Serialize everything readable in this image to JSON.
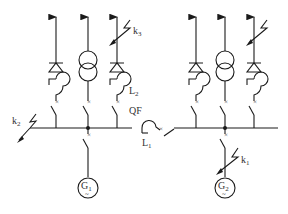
{
  "diagram": {
    "type": "single-line electrical power system diagram",
    "colors": {
      "line": "#1a1a1a",
      "text": "#333333",
      "background": "#ffffff"
    },
    "labels": {
      "k3": {
        "base": "k",
        "sub": "3"
      },
      "k2": {
        "base": "k",
        "sub": "2"
      },
      "k1": {
        "base": "k",
        "sub": "1"
      },
      "L2": {
        "base": "L",
        "sub": "2"
      },
      "L1": {
        "base": "L",
        "sub": "1"
      },
      "QF": {
        "base": "QF",
        "sub": ""
      },
      "G1": {
        "base": "G",
        "sub": "1",
        "symbol": "~"
      },
      "G2": {
        "base": "G",
        "sub": "2",
        "symbol": "~"
      }
    },
    "left_section": {
      "feeders": [
        {
          "id": "left-feeder-1",
          "elements": [
            "arrow",
            "diode-triangle",
            "reactor",
            "breaker"
          ]
        },
        {
          "id": "left-feeder-2",
          "elements": [
            "arrow",
            "transformer",
            "breaker"
          ]
        },
        {
          "id": "left-feeder-3",
          "elements": [
            "arrow",
            "fault-k3",
            "diode-triangle",
            "reactor-L2",
            "breaker"
          ]
        }
      ],
      "generator": "G1",
      "bus_fault": "k2"
    },
    "tie": {
      "reactor": "L1",
      "breaker": "QF"
    },
    "right_section": {
      "feeders": [
        {
          "id": "right-feeder-1",
          "elements": [
            "arrow",
            "diode-triangle",
            "reactor",
            "breaker"
          ]
        },
        {
          "id": "right-feeder-2",
          "elements": [
            "arrow",
            "transformer",
            "breaker"
          ]
        },
        {
          "id": "right-feeder-3",
          "elements": [
            "arrow",
            "fault",
            "diode-triangle",
            "reactor",
            "breaker"
          ]
        }
      ],
      "generator": "G2",
      "generator_fault": "k1"
    },
    "breaker_mark": "×"
  }
}
